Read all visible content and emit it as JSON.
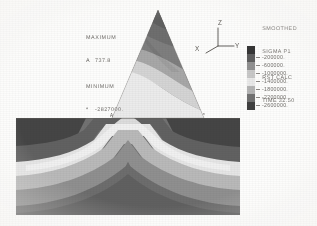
{
  "figure": {
    "kind": "fem-contour-plot",
    "background": "#fdfdfc"
  },
  "annotations": {
    "maximum_label": "MAXIMUM",
    "maximum_symbol": "A",
    "maximum_value": "737.8",
    "minimum_label": "MINIMUM",
    "minimum_symbol": "*",
    "minimum_value": "-2827000."
  },
  "axis_triad": {
    "z_label": "Z",
    "y_label": "Y",
    "x_label": "X"
  },
  "legend": {
    "title_line_1": "SMOOTHED",
    "title_line_2": "SIGMA P1",
    "title_line_3": "RST CALC",
    "title_line_4": "TIME 32.50"
  },
  "chart_data": {
    "type": "heatmap",
    "title": "SMOOTHED SIGMA P1",
    "subtitle": "RST CALC   TIME 32.50",
    "xlabel": "",
    "ylabel": "",
    "colormap": "grayscale",
    "legend_position": "right",
    "grid": false,
    "contour_levels": [
      -200000,
      -600000,
      -1000000,
      -1400000,
      -1800000,
      -2200000,
      -2600000
    ],
    "contour_level_labels": [
      "-200000.",
      "-600000.",
      "-1000000.",
      "-1400000.",
      "-1800000.",
      "-2200000.",
      "-2600000."
    ],
    "level_colors": [
      "#2f2f2f",
      "#5a5a5a",
      "#8f8f8f",
      "#c9c9c9",
      "#ececec",
      "#b4b4b4",
      "#6e6e6e",
      "#3a3a3a"
    ],
    "data_minimum": -2827000,
    "data_maximum": 737.8,
    "minimum_marker": "*",
    "maximum_marker": "A",
    "geometry": "symmetric triangular embankment over horizontal layered foundation",
    "units": "stress"
  },
  "base_markers": {
    "left_marker": "A",
    "right_marker": "*"
  }
}
